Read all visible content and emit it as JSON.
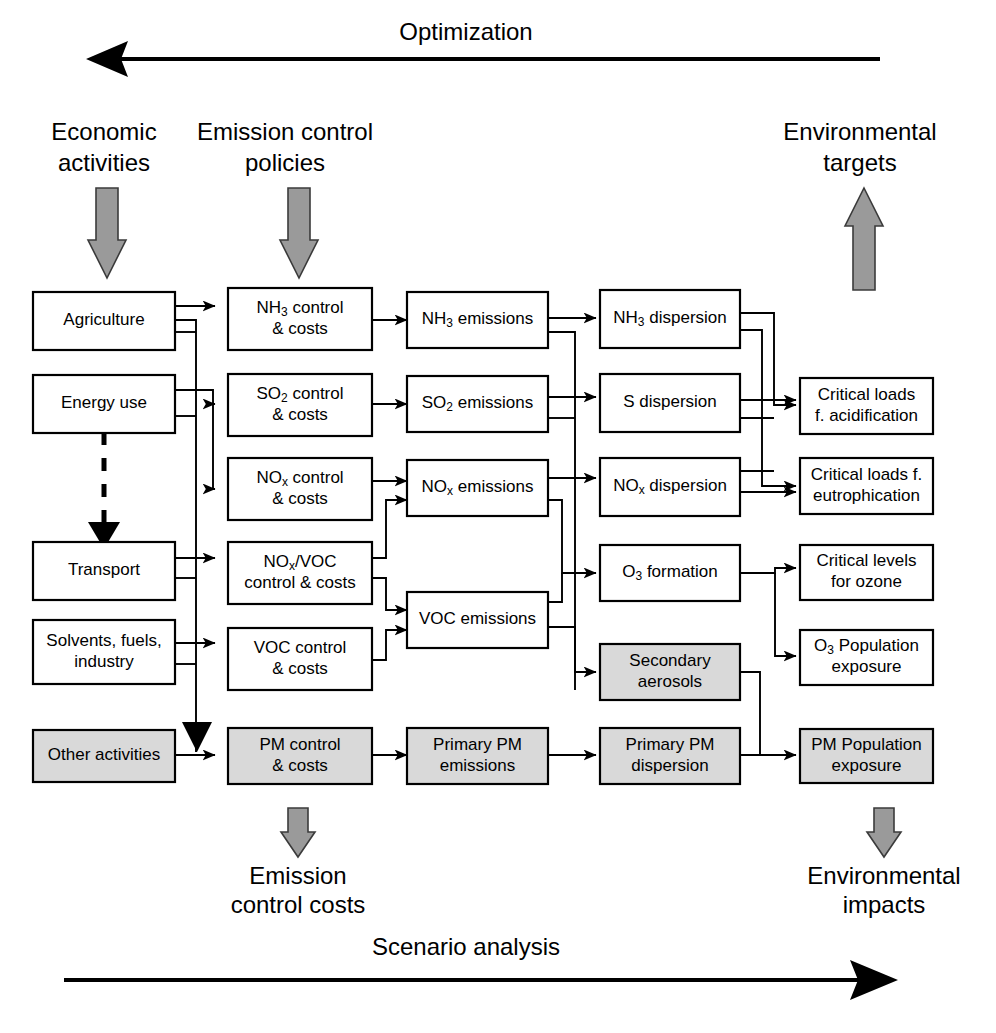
{
  "header": {
    "top_axis_label": "Optimization",
    "bottom_axis_label": "Scenario analysis",
    "columns": [
      {
        "id": "economic-activities",
        "line1": "Economic",
        "line2": "activities"
      },
      {
        "id": "emission-control-policies",
        "line1": "Emission control",
        "line2": "policies"
      },
      {
        "id": "environmental-targets",
        "line1": "Environmental",
        "line2": "targets"
      }
    ],
    "footers": [
      {
        "id": "emission-control-costs",
        "line1": "Emission",
        "line2": "control costs"
      },
      {
        "id": "environmental-impacts",
        "line1": "Environmental",
        "line2": "impacts"
      }
    ]
  },
  "colors": {
    "box_fill": "#ffffff",
    "box_fill_shaded": "#d9d9d9",
    "stroke": "#000000",
    "block_arrow_fill": "#9a9a9a",
    "background": "#ffffff"
  },
  "columns": {
    "activities": {
      "name": "Economic activities",
      "boxes": [
        {
          "id": "agriculture",
          "lines": [
            "Agriculture"
          ],
          "shaded": false
        },
        {
          "id": "energy-use",
          "lines": [
            "Energy use"
          ],
          "shaded": false
        },
        {
          "id": "transport",
          "lines": [
            "Transport"
          ],
          "shaded": false
        },
        {
          "id": "solvents-fuels-industry",
          "lines": [
            "Solvents, fuels,",
            "industry"
          ],
          "shaded": false
        },
        {
          "id": "other-activities",
          "lines": [
            "Other activities"
          ],
          "shaded": true
        }
      ]
    },
    "controls": {
      "name": "Emission control policies",
      "boxes": [
        {
          "id": "nh3-control",
          "lines": [
            "NH#3# control",
            "& costs"
          ],
          "shaded": false
        },
        {
          "id": "so2-control",
          "lines": [
            "SO#2# control",
            "& costs"
          ],
          "shaded": false
        },
        {
          "id": "nox-control",
          "lines": [
            "NO#x# control",
            "& costs"
          ],
          "shaded": false
        },
        {
          "id": "nox-voc-control",
          "lines": [
            "NO#x#/VOC",
            "control & costs"
          ],
          "shaded": false
        },
        {
          "id": "voc-control",
          "lines": [
            "VOC control",
            "& costs"
          ],
          "shaded": false
        },
        {
          "id": "pm-control",
          "lines": [
            "PM control",
            "& costs"
          ],
          "shaded": true
        }
      ]
    },
    "emissions": {
      "name": "Emissions",
      "boxes": [
        {
          "id": "nh3-emissions",
          "lines": [
            "NH#3# emissions"
          ],
          "shaded": false
        },
        {
          "id": "so2-emissions",
          "lines": [
            "SO#2# emissions"
          ],
          "shaded": false
        },
        {
          "id": "nox-emissions",
          "lines": [
            "NO#x# emissions"
          ],
          "shaded": false
        },
        {
          "id": "voc-emissions",
          "lines": [
            "VOC emissions"
          ],
          "shaded": false
        },
        {
          "id": "primary-pm-emissions",
          "lines": [
            "Primary PM",
            "emissions"
          ],
          "shaded": true
        }
      ]
    },
    "dispersion": {
      "name": "Atmospheric dispersion",
      "boxes": [
        {
          "id": "nh3-dispersion",
          "lines": [
            "NH#3# dispersion"
          ],
          "shaded": false
        },
        {
          "id": "s-dispersion",
          "lines": [
            "S dispersion"
          ],
          "shaded": false
        },
        {
          "id": "nox-dispersion",
          "lines": [
            "NO#x# dispersion"
          ],
          "shaded": false
        },
        {
          "id": "o3-formation",
          "lines": [
            "O#3# formation"
          ],
          "shaded": false
        },
        {
          "id": "secondary-aerosols",
          "lines": [
            "Secondary",
            "aerosols"
          ],
          "shaded": true
        },
        {
          "id": "primary-pm-dispersion",
          "lines": [
            "Primary PM",
            "dispersion"
          ],
          "shaded": true
        }
      ]
    },
    "targets": {
      "name": "Environmental targets",
      "boxes": [
        {
          "id": "critical-loads-acidification",
          "lines": [
            "Critical loads",
            "f. acidification"
          ],
          "shaded": false
        },
        {
          "id": "critical-loads-eutrophication",
          "lines": [
            "Critical loads f.",
            "eutrophication"
          ],
          "shaded": false
        },
        {
          "id": "critical-levels-ozone",
          "lines": [
            "Critical levels",
            "for ozone"
          ],
          "shaded": false
        },
        {
          "id": "o3-population-exposure",
          "lines": [
            "O#3# Population",
            "exposure"
          ],
          "shaded": false
        },
        {
          "id": "pm-population-exposure",
          "lines": [
            "PM Population",
            "exposure"
          ],
          "shaded": true
        }
      ]
    }
  },
  "icons": {
    "down_block_arrow": "down-block-arrow-icon",
    "up_block_arrow": "up-block-arrow-icon",
    "left_axis_arrow": "left-arrow-icon",
    "right_axis_arrow": "right-arrow-icon",
    "dashed_arrow": "dashed-down-arrow-icon"
  }
}
